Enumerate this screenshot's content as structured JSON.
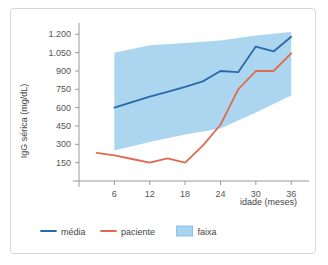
{
  "chart_data": {
    "type": "line",
    "title": "",
    "xlabel": "idade (meses)",
    "ylabel": "IgG sérica (mg/dL)",
    "xlim": [
      0,
      38
    ],
    "ylim": [
      0,
      1260
    ],
    "grid": false,
    "legend_position": "bottom",
    "xticks": [
      6,
      12,
      18,
      24,
      30,
      36
    ],
    "xtick_labels": [
      "6",
      "12",
      "18",
      "24",
      "30",
      "36"
    ],
    "yticks": [
      150,
      300,
      450,
      600,
      750,
      900,
      1050,
      1200
    ],
    "ytick_labels": [
      "150",
      "300",
      "450",
      "600",
      "750",
      "900",
      "1.050",
      "1.200"
    ],
    "series": [
      {
        "name": "média",
        "type": "line",
        "color": "#2a6aa8",
        "x": [
          6,
          9,
          12,
          15,
          18,
          21,
          24,
          27,
          30,
          33,
          36
        ],
        "values": [
          600,
          645,
          690,
          730,
          770,
          815,
          900,
          890,
          1100,
          1060,
          1180
        ]
      },
      {
        "name": "paciente",
        "type": "line",
        "color": "#df6a52",
        "x": [
          3,
          6,
          9,
          12,
          15,
          18,
          21,
          24,
          27,
          30,
          33,
          36
        ],
        "values": [
          230,
          210,
          180,
          150,
          185,
          150,
          290,
          460,
          750,
          900,
          900,
          1045
        ]
      },
      {
        "name": "faixa",
        "type": "band",
        "color": "#a8d4ef",
        "x": [
          6,
          12,
          18,
          24,
          30,
          36
        ],
        "lower": [
          250,
          320,
          380,
          430,
          560,
          700
        ],
        "upper": [
          1050,
          1110,
          1130,
          1150,
          1190,
          1220
        ]
      }
    ],
    "legend": [
      {
        "label": "média",
        "marker": "line",
        "color": "#2a6aa8"
      },
      {
        "label": "paciente",
        "marker": "line",
        "color": "#df6a52"
      },
      {
        "label": "faixa",
        "marker": "swatch",
        "color": "#a8d4ef"
      }
    ]
  }
}
